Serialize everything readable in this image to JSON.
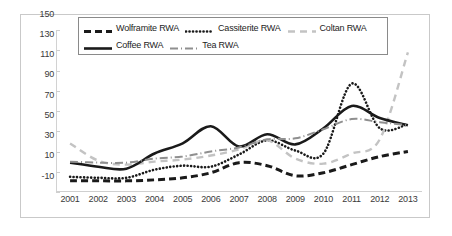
{
  "chart_data": {
    "type": "line",
    "title": "",
    "xlabel": "",
    "ylabel": "",
    "categories": [
      "2001",
      "2002",
      "2003",
      "2004",
      "2005",
      "2006",
      "2007",
      "2008",
      "2009",
      "2010",
      "2011",
      "2012",
      "2013"
    ],
    "x": [
      2001,
      2002,
      2003,
      2004,
      2005,
      2006,
      2007,
      2008,
      2009,
      2010,
      2011,
      2012,
      2013
    ],
    "ylim": [
      -10,
      150
    ],
    "ytick_labels": [
      "-10",
      "10",
      "30",
      "50",
      "70",
      "90",
      "110",
      "130",
      "150"
    ],
    "yticks": [
      -10,
      10,
      30,
      50,
      70,
      90,
      110,
      130,
      150
    ],
    "grid": false,
    "legend_position": "top-inside",
    "series": [
      {
        "name": "Wolframite RWA",
        "style": "dashed",
        "color": "#1a1a1a",
        "width": 3,
        "values": [
          1,
          1,
          1,
          2,
          4,
          9,
          19,
          16,
          6,
          9,
          17,
          25,
          30
        ]
      },
      {
        "name": "Cassiterite RWA",
        "style": "dotted",
        "color": "#1a1a1a",
        "width": 2.6,
        "values": [
          5,
          4,
          4,
          12,
          16,
          15,
          27,
          41,
          31,
          28,
          97,
          53,
          57
        ]
      },
      {
        "name": "Coltan RWA",
        "style": "dashed",
        "color": "#c3c3c3",
        "width": 2.4,
        "values": [
          38,
          21,
          17,
          20,
          22,
          26,
          32,
          41,
          23,
          18,
          28,
          42,
          128
        ]
      },
      {
        "name": "Coffee RWA",
        "style": "solid",
        "color": "#1a1a1a",
        "width": 2.6,
        "values": [
          19,
          15,
          13,
          28,
          38,
          55,
          35,
          47,
          37,
          53,
          75,
          63,
          56
        ]
      },
      {
        "name": "Tea RWA",
        "style": "dashdot",
        "color": "#8f8f8f",
        "width": 2,
        "values": [
          20,
          19,
          19,
          23,
          25,
          30,
          34,
          42,
          43,
          52,
          62,
          59,
          56
        ]
      }
    ]
  },
  "legend": {
    "rows": [
      [
        {
          "label": "Wolframite RWA",
          "series_index": 0
        },
        {
          "label": "Cassiterite RWA",
          "series_index": 1
        },
        {
          "label": "Coltan RWA",
          "series_index": 2
        }
      ],
      [
        {
          "label": "Coffee RWA",
          "series_index": 3
        },
        {
          "label": "Tea RWA",
          "series_index": 4
        }
      ]
    ]
  }
}
